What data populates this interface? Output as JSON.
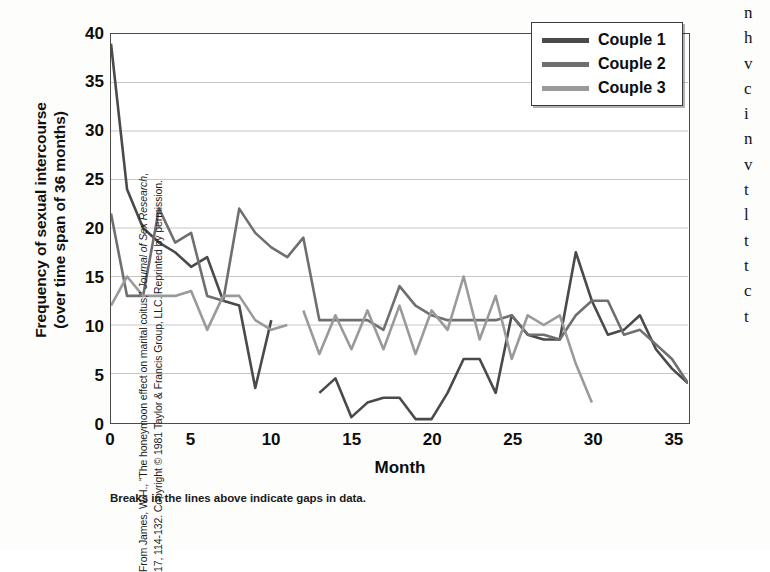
{
  "figure": {
    "x_axis_title": "Month",
    "y_axis_title_line1": "Frequency of sexual intercourse",
    "y_axis_title_line2": "(over time span of 36 months)",
    "caption": "Breaks in the lines above indicate gaps in data.",
    "credit_prefix": "From James, W.H., “The honeymoon effect on marital coitus,” ",
    "credit_italic": "Journal of Sex Research",
    "credit_suffix": ",",
    "credit_line2": "17, 114-132. Copyright © 1981 Taylor & Francis Group, LLC. Reprinted by permission.",
    "edge_column_text": "n\nh\nv\nc\ni\nn\nv\nt\nl\nt\nt\nc\nt"
  },
  "legend": {
    "items": [
      {
        "label": "Couple 1",
        "color": "#4a4a4a"
      },
      {
        "label": "Couple 2",
        "color": "#6f6f6f"
      },
      {
        "label": "Couple 3",
        "color": "#9a9a9a"
      }
    ]
  },
  "chart_data": {
    "type": "line",
    "title": "",
    "xlabel": "Month",
    "ylabel": "Frequency of sexual intercourse (over time span of 36 months)",
    "xlim": [
      0,
      36
    ],
    "ylim": [
      0,
      40
    ],
    "xticks": [
      0,
      5,
      10,
      15,
      20,
      25,
      30,
      35
    ],
    "yticks": [
      0,
      5,
      10,
      15,
      20,
      25,
      30,
      35,
      40
    ],
    "grid": "horizontal",
    "legend_position": "top-right",
    "annotation": "Breaks in the lines above indicate gaps in data.",
    "series": [
      {
        "name": "Couple 1",
        "color": "#4a4a4a",
        "segments": [
          {
            "x": [
              0,
              1,
              2,
              3,
              4,
              5,
              6,
              7,
              8,
              9,
              10
            ],
            "y": [
              39,
              24,
              20,
              18.5,
              17.5,
              16,
              17,
              12.5,
              12,
              3.5,
              10.5
            ]
          },
          {
            "x": [
              13,
              14,
              15,
              16,
              17,
              18,
              19,
              20,
              21,
              22,
              23,
              24,
              25,
              26,
              27,
              28,
              29,
              30,
              31,
              32,
              33,
              34,
              35,
              36
            ],
            "y": [
              3,
              4.5,
              0.5,
              2,
              2.5,
              2.5,
              0.3,
              0.3,
              3,
              6.5,
              6.5,
              3,
              11,
              9,
              8.5,
              8.5,
              17.5,
              12.5,
              9,
              9.5,
              11,
              7.5,
              5.5,
              4
            ]
          }
        ]
      },
      {
        "name": "Couple 2",
        "color": "#6f6f6f",
        "segments": [
          {
            "x": [
              0,
              1,
              2,
              3,
              4,
              5,
              6,
              7,
              8,
              9,
              10,
              11,
              12,
              13,
              14,
              15,
              16,
              17,
              18,
              19,
              20,
              21,
              22,
              23,
              24,
              25,
              26,
              27,
              28,
              29,
              30,
              31,
              32,
              33,
              34,
              35,
              36
            ],
            "y": [
              21.5,
              13,
              13,
              22,
              18.5,
              19.5,
              13,
              12.5,
              22,
              19.5,
              18,
              17,
              19,
              10.5,
              10.5,
              10.5,
              10.5,
              9.5,
              14,
              12,
              11,
              10.5,
              10.5,
              10.5,
              10.5,
              11,
              9,
              9,
              8.5,
              11,
              12.5,
              12.5,
              9,
              9.5,
              8,
              6.5,
              4
            ]
          }
        ]
      },
      {
        "name": "Couple 3",
        "color": "#9a9a9a",
        "segments": [
          {
            "x": [
              0,
              1,
              2,
              3,
              4,
              5,
              6,
              7,
              8,
              9,
              10,
              11
            ],
            "y": [
              12,
              15,
              13,
              13,
              13,
              13.5,
              9.5,
              13,
              13,
              10.5,
              9.5,
              10
            ]
          },
          {
            "x": [
              12,
              13,
              14,
              15,
              16,
              17,
              18,
              19,
              20,
              21,
              22,
              23,
              24,
              25,
              26,
              27,
              28,
              29,
              30
            ],
            "y": [
              11.5,
              7,
              11,
              7.5,
              11.5,
              7.5,
              12,
              7,
              11.5,
              9.5,
              15,
              8.5,
              13,
              6.5,
              11,
              10,
              11,
              6,
              2
            ]
          }
        ]
      }
    ]
  }
}
